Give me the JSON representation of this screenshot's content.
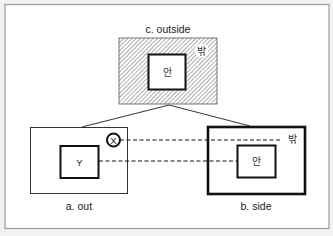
{
  "diagram": {
    "panel_c": {
      "caption": "c. outside",
      "outer_label": "밖",
      "inner_label": "안"
    },
    "panel_a": {
      "caption": "a. out",
      "inner_label": "Y",
      "circle_label": "X"
    },
    "panel_b": {
      "caption": "b. side",
      "outer_label": "밖",
      "inner_label": "안"
    },
    "colors": {
      "background": "#f2f2f2",
      "frame": "#ffffff",
      "frame_border": "#999999",
      "stroke": "#111111",
      "hatch": "#8a8a8a"
    }
  }
}
